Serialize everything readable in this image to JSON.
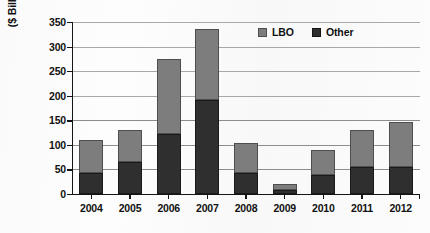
{
  "chart_data": {
    "type": "bar",
    "subtype": "stacked-vertical-bar",
    "title": "",
    "xlabel": "",
    "ylabel": "($ Billions)",
    "categories": [
      "2004",
      "2005",
      "2006",
      "2007",
      "2008",
      "2009",
      "2010",
      "2011",
      "2012"
    ],
    "series": [
      {
        "name": "Other",
        "color": "#2f2f2f",
        "values": [
          42,
          65,
          122,
          192,
          42,
          8,
          38,
          55,
          55
        ]
      },
      {
        "name": "LBO",
        "color": "#7d7d7d",
        "values": [
          68,
          65,
          153,
          143,
          61,
          12,
          52,
          75,
          92
        ]
      }
    ],
    "totals": [
      110,
      130,
      275,
      335,
      103,
      20,
      90,
      130,
      147
    ],
    "stack_order": [
      "Other",
      "LBO"
    ],
    "ylim": [
      0,
      350
    ],
    "ytick_values": [
      0,
      50,
      100,
      150,
      200,
      250,
      300,
      350
    ],
    "ytick_labels": [
      "0",
      "50",
      "100",
      "150",
      "200",
      "250",
      "300",
      "350"
    ],
    "grid": true,
    "grid_axis": "y",
    "legend_position": "top-right-inside",
    "legend": [
      {
        "label": "LBO",
        "swatch": "lbo-swatch-icon",
        "color": "#7d7d7d"
      },
      {
        "label": "Other",
        "swatch": "other-swatch-icon",
        "color": "#2f2f2f"
      }
    ]
  }
}
